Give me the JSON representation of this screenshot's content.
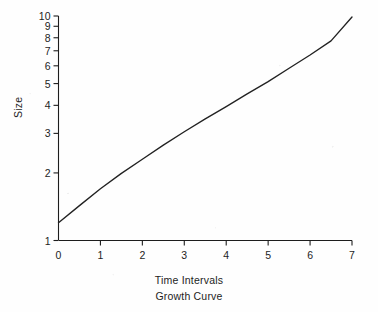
{
  "figure": {
    "caption": "Growth Curve",
    "background_color": "#fefefe",
    "ink_color": "#1d1d1d"
  },
  "chart_data": {
    "type": "line",
    "title": "",
    "caption": "Growth Curve",
    "xlabel": "Time Intervals",
    "ylabel": "Size",
    "yscale": "log",
    "xscale": "linear",
    "xlim": [
      0,
      7
    ],
    "ylim": [
      1,
      10
    ],
    "grid": false,
    "legend": false,
    "x_ticks": [
      0,
      1,
      2,
      3,
      4,
      5,
      6,
      7
    ],
    "x_tick_labels": [
      "0",
      "1",
      "2",
      "3",
      "4",
      "5",
      "6",
      "7"
    ],
    "y_ticks": [
      1,
      2,
      3,
      4,
      5,
      6,
      7,
      8,
      9,
      10
    ],
    "y_tick_labels": [
      "1",
      "2",
      "3",
      "4",
      "5",
      "6",
      "7",
      "8",
      "9",
      "10"
    ],
    "series": [
      {
        "name": "Growth",
        "x": [
          0,
          0.5,
          1,
          1.5,
          2,
          2.5,
          3,
          3.5,
          4,
          4.5,
          5,
          5.5,
          6,
          6.5,
          7
        ],
        "y": [
          1.2,
          1.43,
          1.7,
          1.99,
          2.3,
          2.66,
          3.05,
          3.48,
          3.95,
          4.5,
          5.1,
          5.85,
          6.7,
          7.75,
          9.9
        ]
      }
    ]
  }
}
